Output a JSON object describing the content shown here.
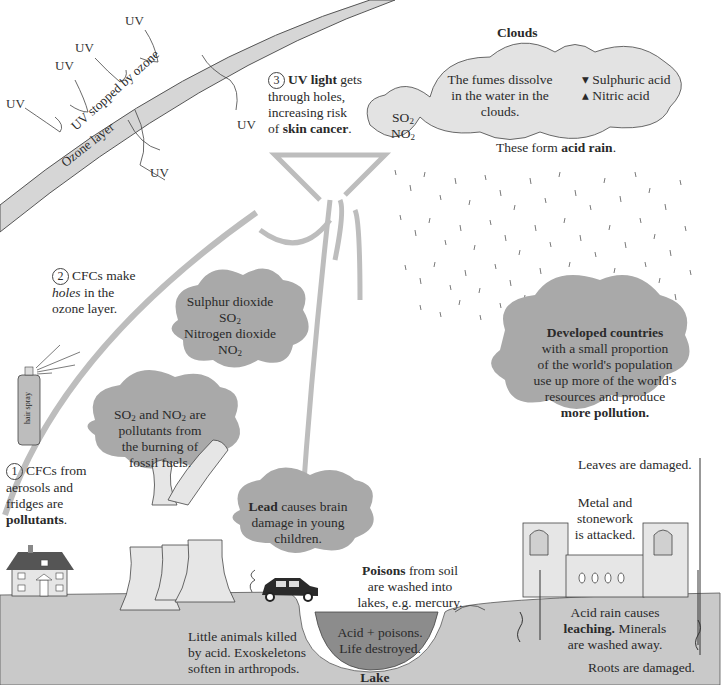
{
  "ozone": {
    "layer_label": "Ozone layer",
    "stopped_label": "UV stopped by ozone",
    "uv_label": "UV"
  },
  "steps": {
    "step1": {
      "number": "1",
      "text_a": "CFCs from",
      "text_b": "aerosols and",
      "text_c": "fridges are",
      "text_bold": "pollutants",
      "text_end": "."
    },
    "step2": {
      "number": "2",
      "text_a": "CFCs make",
      "text_italic": "holes",
      "text_b": " in the",
      "text_c": "ozone layer."
    },
    "step3": {
      "number": "3",
      "text_bold1": "UV light",
      "text_a": " gets",
      "text_b": "through holes,",
      "text_c": "increasing risk",
      "text_d": "of ",
      "text_bold2": "skin cancer",
      "text_end": "."
    }
  },
  "clouds": {
    "title": "Clouds",
    "small_cloud": {
      "line1": "SO",
      "line1_sub": "2",
      "line2": "NO",
      "line2_sub": "2"
    },
    "middle_cloud": {
      "line1": "The fumes dissolve",
      "line2": "in the water in the",
      "line3": "clouds."
    },
    "right_cloud": {
      "acid1": "Sulphuric acid",
      "acid2": "Nitric acid"
    },
    "form_text": "These form ",
    "form_bold": "acid rain",
    "form_end": "."
  },
  "gas_cloud": {
    "line1": "Sulphur dioxide",
    "line2": "SO",
    "line2_sub": "2",
    "line3": "Nitrogen dioxide",
    "line4": "NO",
    "line4_sub": "2"
  },
  "fossil_cloud": {
    "line1a": "SO",
    "line1a_sub": "2",
    "line1b": " and NO",
    "line1b_sub": "2",
    "line1c": " are",
    "line2": "pollutants from",
    "line3": "the burning of",
    "line4": "fossil fuels."
  },
  "lead_cloud": {
    "bold": "Lead",
    "line1": " causes brain",
    "line2": "damage in young",
    "line3": "children."
  },
  "developed_cloud": {
    "bold1": "Developed countries",
    "line2": "with a small proportion",
    "line3": "of the world's population",
    "line4": "use up more of the world's",
    "line5": "resources and produce",
    "bold2": "more pollution."
  },
  "hair_spray_label": "hair spray",
  "ground": {
    "animals": {
      "line1": "Little animals killed",
      "line2": "by acid. Exoskeletons",
      "line3": "soften in arthropods."
    },
    "poisons": {
      "bold": "Poisons",
      "line1": " from soil",
      "line2": "are washed into",
      "line3": "lakes, e.g. mercury."
    },
    "lake_text": {
      "line1": "Acid + poisons.",
      "line2": "Life destroyed."
    },
    "lake_label": "Lake",
    "metal": {
      "line1": "Metal and",
      "line2": "stonework",
      "line3": "is attacked."
    },
    "leaves": "Leaves are damaged.",
    "leaching": {
      "line1": "Acid rain causes",
      "bold": "leaching.",
      "line2b": " Minerals",
      "line3": "are washed away."
    },
    "roots": "Roots are damaged."
  },
  "colors": {
    "ground": "#c9c9c9",
    "lake": "#8c8c8c",
    "cloud_dark": "#a9a9a9",
    "cloud_light": "#e3e3e3",
    "ozone": "#d6d6d6",
    "arrow": "#bdbdbd"
  }
}
